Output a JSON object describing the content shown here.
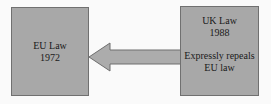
{
  "diagram": {
    "type": "flow-diagram",
    "background_color": "#fafafa",
    "node_fill_color": "#a8a8a8",
    "node_border_color": "#707070",
    "arrow_fill_color": "#acacac",
    "nodes": [
      {
        "id": "eu-law",
        "lines": [
          "EU Law",
          "1972"
        ],
        "line1": "EU Law",
        "line2": "1972"
      },
      {
        "id": "uk-law",
        "lines": [
          "UK Law",
          "1988",
          "Expressly repeals",
          "EU law"
        ],
        "line1": "UK Law",
        "line2": "1988",
        "line3": "Expressly repeals",
        "line4": "EU law"
      }
    ],
    "arrow": {
      "name": "repeals-arrow",
      "direction": "left",
      "from": "uk-law",
      "to": "eu-law"
    }
  }
}
